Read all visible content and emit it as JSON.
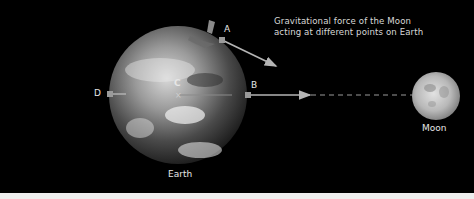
{
  "diagram": {
    "title_lines": [
      "Gravitational force of the Moon",
      "acting at different points on Earth"
    ],
    "bodies": {
      "earth": {
        "label": "Earth",
        "center": [
          178,
          95
        ],
        "radius": 69
      },
      "moon": {
        "label": "Moon",
        "center": [
          436,
          96
        ],
        "radius": 24
      }
    },
    "points": [
      {
        "id": "A",
        "label": "A",
        "position": [
          222,
          40
        ]
      },
      {
        "id": "B",
        "label": "B",
        "position": [
          248,
          95
        ]
      },
      {
        "id": "C",
        "label": "C",
        "position": [
          178,
          94
        ],
        "marker": "×"
      },
      {
        "id": "D",
        "label": "D",
        "position": [
          110,
          94
        ]
      }
    ],
    "arrows": [
      {
        "from": "A",
        "to": [
          277,
          66
        ],
        "description": "force at A"
      },
      {
        "from": "B",
        "to": [
          311,
          95
        ],
        "description": "force at B"
      },
      {
        "from": "C",
        "to": [
          232,
          95
        ],
        "description": "force at C"
      },
      {
        "from": "D",
        "to": [
          126,
          94
        ],
        "description": "force at D"
      }
    ],
    "connector": {
      "style": "dashed",
      "from": [
        311,
        95
      ],
      "to": [
        413,
        95
      ]
    },
    "colors": {
      "background": "#000000",
      "arrow": "#b5b5b5",
      "marker": "#9a9a9a",
      "text": "#e6e6e6"
    }
  }
}
